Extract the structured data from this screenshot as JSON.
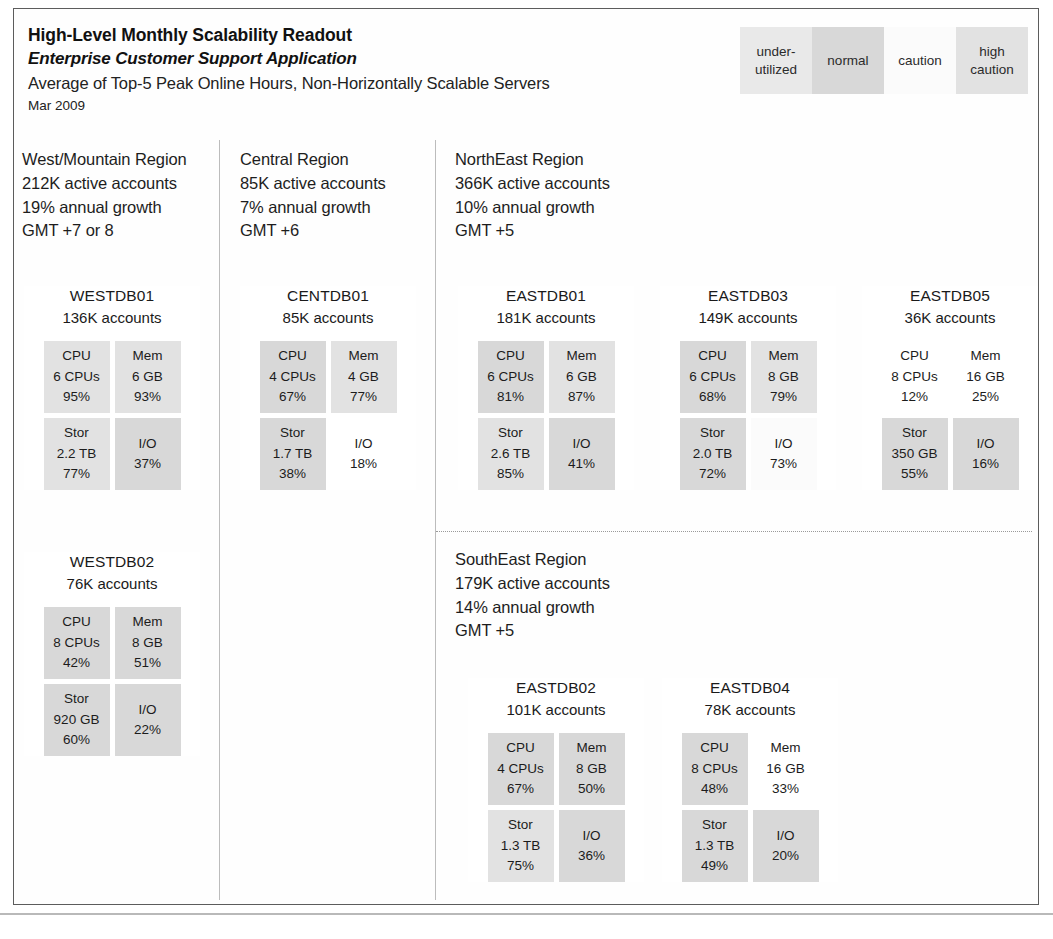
{
  "header": {
    "title": "High-Level Monthly Scalability Readout",
    "subtitle": "Enterprise Customer Support Application",
    "caption": "Average of Top-5 Peak Online Hours, Non-Horizontally Scalable Servers",
    "period": "Mar 2009"
  },
  "legend": {
    "items": [
      {
        "label": "under-utilized",
        "status": "under-utilized",
        "color": "#e9e9e9"
      },
      {
        "label": "normal",
        "status": "normal",
        "color": "#d8d8d8"
      },
      {
        "label": "caution",
        "status": "caution",
        "color": "#fbfbfb"
      },
      {
        "label": "high caution",
        "status": "high-caution",
        "color": "#e2e2e2"
      }
    ]
  },
  "regions": {
    "west": {
      "name": "West/Mountain Region",
      "accounts": "212K active accounts",
      "growth": "19% annual growth",
      "timezone": "GMT +7 or 8"
    },
    "central": {
      "name": "Central Region",
      "accounts": "85K active accounts",
      "growth": "7% annual growth",
      "timezone": "GMT +6"
    },
    "northeast": {
      "name": "NorthEast Region",
      "accounts": "366K active accounts",
      "growth": "10% annual growth",
      "timezone": "GMT +5"
    },
    "southeast": {
      "name": "SouthEast Region",
      "accounts": "179K active accounts",
      "growth": "14% annual growth",
      "timezone": "GMT +5"
    }
  },
  "servers": {
    "WESTDB01": {
      "name": "WESTDB01",
      "accounts": "136K accounts",
      "metrics": [
        {
          "label": "CPU",
          "capacity": "6 CPUs",
          "pct": "95%",
          "status": "high-caution"
        },
        {
          "label": "Mem",
          "capacity": "6 GB",
          "pct": "93%",
          "status": "high-caution"
        },
        {
          "label": "Stor",
          "capacity": "2.2 TB",
          "pct": "77%",
          "status": "high-caution"
        },
        {
          "label": "I/O",
          "capacity": "",
          "pct": "37%",
          "status": "normal"
        }
      ]
    },
    "WESTDB02": {
      "name": "WESTDB02",
      "accounts": "76K accounts",
      "metrics": [
        {
          "label": "CPU",
          "capacity": "8 CPUs",
          "pct": "42%",
          "status": "normal"
        },
        {
          "label": "Mem",
          "capacity": "8 GB",
          "pct": "51%",
          "status": "normal"
        },
        {
          "label": "Stor",
          "capacity": "920 GB",
          "pct": "60%",
          "status": "normal"
        },
        {
          "label": "I/O",
          "capacity": "",
          "pct": "22%",
          "status": "normal"
        }
      ]
    },
    "CENTDB01": {
      "name": "CENTDB01",
      "accounts": "85K accounts",
      "metrics": [
        {
          "label": "CPU",
          "capacity": "4 CPUs",
          "pct": "67%",
          "status": "normal"
        },
        {
          "label": "Mem",
          "capacity": "4 GB",
          "pct": "77%",
          "status": "high-caution"
        },
        {
          "label": "Stor",
          "capacity": "1.7 TB",
          "pct": "38%",
          "status": "normal"
        },
        {
          "label": "I/O",
          "capacity": "",
          "pct": "18%",
          "status": "under-utilized"
        }
      ]
    },
    "EASTDB01": {
      "name": "EASTDB01",
      "accounts": "181K accounts",
      "metrics": [
        {
          "label": "CPU",
          "capacity": "6 CPUs",
          "pct": "81%",
          "status": "normal"
        },
        {
          "label": "Mem",
          "capacity": "6 GB",
          "pct": "87%",
          "status": "high-caution"
        },
        {
          "label": "Stor",
          "capacity": "2.6 TB",
          "pct": "85%",
          "status": "high-caution"
        },
        {
          "label": "I/O",
          "capacity": "",
          "pct": "41%",
          "status": "normal"
        }
      ]
    },
    "EASTDB03": {
      "name": "EASTDB03",
      "accounts": "149K accounts",
      "metrics": [
        {
          "label": "CPU",
          "capacity": "6 CPUs",
          "pct": "68%",
          "status": "normal"
        },
        {
          "label": "Mem",
          "capacity": "8 GB",
          "pct": "79%",
          "status": "high-caution"
        },
        {
          "label": "Stor",
          "capacity": "2.0 TB",
          "pct": "72%",
          "status": "normal"
        },
        {
          "label": "I/O",
          "capacity": "",
          "pct": "73%",
          "status": "caution"
        }
      ]
    },
    "EASTDB05": {
      "name": "EASTDB05",
      "accounts": "36K accounts",
      "metrics": [
        {
          "label": "CPU",
          "capacity": "8 CPUs",
          "pct": "12%",
          "status": "under-utilized"
        },
        {
          "label": "Mem",
          "capacity": "16 GB",
          "pct": "25%",
          "status": "under-utilized"
        },
        {
          "label": "Stor",
          "capacity": "350 GB",
          "pct": "55%",
          "status": "normal"
        },
        {
          "label": "I/O",
          "capacity": "",
          "pct": "16%",
          "status": "normal"
        }
      ]
    },
    "EASTDB02": {
      "name": "EASTDB02",
      "accounts": "101K accounts",
      "metrics": [
        {
          "label": "CPU",
          "capacity": "4 CPUs",
          "pct": "67%",
          "status": "normal"
        },
        {
          "label": "Mem",
          "capacity": "8 GB",
          "pct": "50%",
          "status": "normal"
        },
        {
          "label": "Stor",
          "capacity": "1.3 TB",
          "pct": "75%",
          "status": "high-caution"
        },
        {
          "label": "I/O",
          "capacity": "",
          "pct": "36%",
          "status": "normal"
        }
      ]
    },
    "EASTDB04": {
      "name": "EASTDB04",
      "accounts": "78K accounts",
      "metrics": [
        {
          "label": "CPU",
          "capacity": "8 CPUs",
          "pct": "48%",
          "status": "normal"
        },
        {
          "label": "Mem",
          "capacity": "16 GB",
          "pct": "33%",
          "status": "under-utilized"
        },
        {
          "label": "Stor",
          "capacity": "1.3 TB",
          "pct": "49%",
          "status": "normal"
        },
        {
          "label": "I/O",
          "capacity": "",
          "pct": "20%",
          "status": "normal"
        }
      ]
    }
  }
}
